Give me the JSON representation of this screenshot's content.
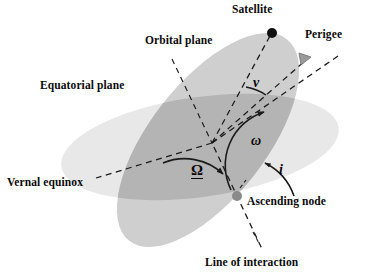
{
  "figure": {
    "type": "orbital-elements-diagram",
    "background_color": "#ffffff"
  },
  "colors": {
    "equatorial_plane_fill": "#e8e8e8",
    "orbital_plane_fill": "#cfcfcf",
    "overlap_fill": "#b4b4b4",
    "line_color": "#1a1a1a",
    "satellite_dot": "#111111",
    "node_dot": "#8a8a8a",
    "text_color": "#0a0a0a"
  },
  "labels": {
    "satellite": "Satellite",
    "perigee": "Perigee",
    "orbital_plane": "Orbital plane",
    "equatorial_plane": "Equatorial plane",
    "vernal_equinox": "Vernal equinox",
    "ascending_node": "Ascending node",
    "line_of_intersection": "Line of interaction"
  },
  "angles": {
    "true_anomaly": {
      "symbol": "ν",
      "name": "true anomaly",
      "x": 253,
      "y": 77
    },
    "argument_of_perigee": {
      "symbol": "ω",
      "name": "argument of perigee",
      "x": 252,
      "y": 136
    },
    "raan": {
      "symbol": "Ω",
      "name": "right ascension of ascending node",
      "x": 192,
      "y": 165
    },
    "inclination": {
      "symbol": "i",
      "name": "inclination",
      "x": 279,
      "y": 165
    }
  },
  "points": {
    "satellite": {
      "x": 272,
      "y": 33,
      "radius": 5.0
    },
    "ascending_node": {
      "x": 237,
      "y": 196,
      "radius": 5.0
    },
    "earth_center": {
      "x": 212,
      "y": 143
    }
  },
  "label_positions": {
    "satellite": {
      "x": 232,
      "y": 5
    },
    "perigee": {
      "x": 306,
      "y": 30
    },
    "orbital_plane": {
      "x": 146,
      "y": 36
    },
    "equatorial_plane": {
      "x": 41,
      "y": 81
    },
    "vernal_equinox": {
      "x": 8,
      "y": 178
    },
    "ascending_node": {
      "x": 248,
      "y": 197
    },
    "line_of_intersection": {
      "x": 206,
      "y": 258
    }
  }
}
